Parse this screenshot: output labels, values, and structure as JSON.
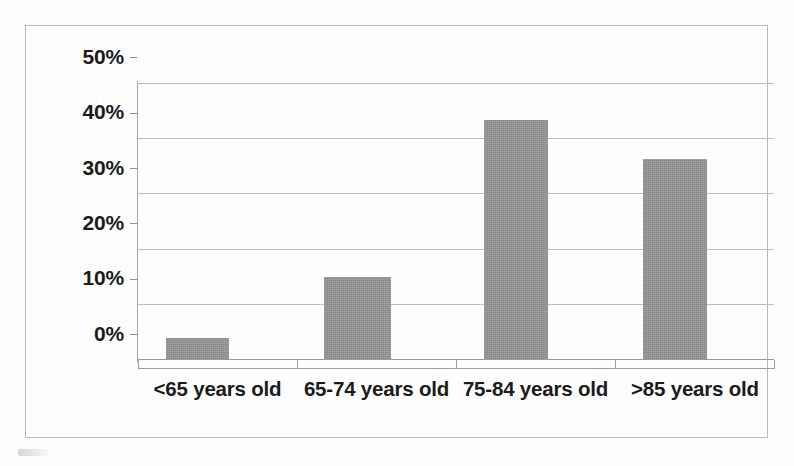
{
  "chart_data": {
    "type": "bar",
    "title": "",
    "subtitle": "",
    "xlabel": "",
    "ylabel": "",
    "categories": [
      "<65 years old",
      "65-74 years old",
      "75-84 years old",
      ">85 years old"
    ],
    "values": [
      4,
      15,
      43.5,
      36.5
    ],
    "value_format": "percent",
    "ylim": [
      0,
      50
    ],
    "ytick_labels": [
      "50%",
      "40%",
      "30%",
      "20%",
      "10%",
      "0%"
    ],
    "ytick_values": [
      50,
      40,
      30,
      20,
      10,
      0
    ],
    "grid": true,
    "grid_axis": "y",
    "legend": false,
    "legend_position": "none",
    "series": [
      {
        "name": "",
        "values": [
          4,
          15,
          43.5,
          36.5
        ]
      }
    ],
    "colors": {
      "bar_fill": "#959595",
      "gridline": "#bdbdbd",
      "axis_line": "#9d9d9d",
      "frame_border": "#b9b9b9",
      "text": "#1b1b1b",
      "background": "#fefefe"
    }
  },
  "figure": {
    "frame_label": "bar-chart-frame"
  }
}
